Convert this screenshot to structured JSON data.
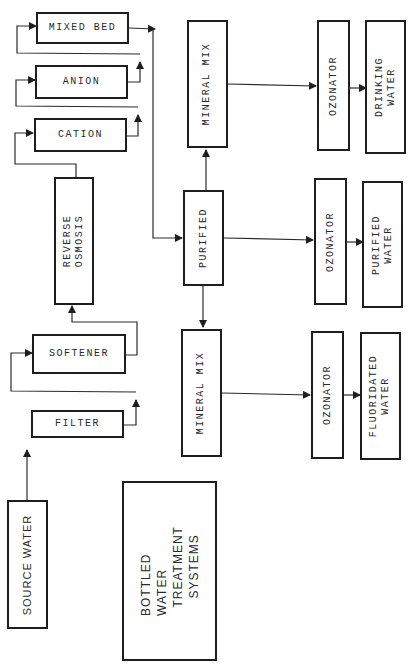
{
  "diagram": {
    "title": "BOTTLED\nWATER\n  TREATMENT\n    SYSTEMS",
    "nodes": {
      "source_water": "SOURCE WATER",
      "filter": "FILTER",
      "softener": "SOFTENER",
      "reverse_osmosis": "REVERSE\nOSMOSIS",
      "cation": "CATION",
      "anion": "ANION",
      "mixed_bed": "MIXED BED",
      "purified": "PURIFIED",
      "mineral_mix_top": "MINERAL MIX",
      "mineral_mix_bottom": "MINERAL MIX",
      "ozonator_top": "OZONATOR",
      "ozonator_mid": "OZONATOR",
      "ozonator_bottom": "OZONATOR",
      "drinking_water": "DRINKING\nWATER",
      "purified_water": "PURIFIED\nWATER",
      "fluoridated_water": "FLUORIDATED\nWATER"
    },
    "edges": [
      {
        "from": "SOURCE WATER",
        "to": "FILTER"
      },
      {
        "from": "FILTER",
        "to": "SOFTENER"
      },
      {
        "from": "SOFTENER",
        "to": "REVERSE OSMOSIS"
      },
      {
        "from": "REVERSE OSMOSIS",
        "to": "CATION"
      },
      {
        "from": "CATION",
        "to": "ANION"
      },
      {
        "from": "ANION",
        "to": "MIXED BED"
      },
      {
        "from": "MIXED BED",
        "to": "PURIFIED"
      },
      {
        "from": "PURIFIED",
        "to": "MINERAL MIX (top)"
      },
      {
        "from": "PURIFIED",
        "to": "MINERAL MIX (bottom)"
      },
      {
        "from": "PURIFIED",
        "to": "OZONATOR (middle)"
      },
      {
        "from": "MINERAL MIX (top)",
        "to": "OZONATOR (top)"
      },
      {
        "from": "MINERAL MIX (bottom)",
        "to": "OZONATOR (bottom)"
      },
      {
        "from": "OZONATOR (top)",
        "to": "DRINKING WATER"
      },
      {
        "from": "OZONATOR (middle)",
        "to": "PURIFIED WATER"
      },
      {
        "from": "OZONATOR (bottom)",
        "to": "FLUORIDATED WATER"
      }
    ]
  }
}
